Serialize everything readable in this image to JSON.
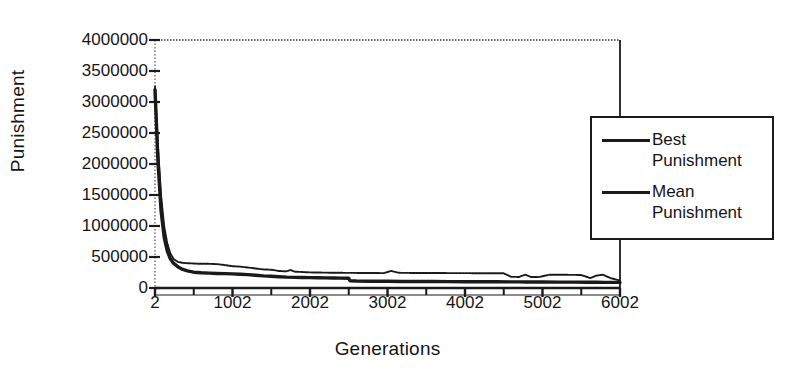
{
  "chart_data": {
    "type": "line",
    "title": "",
    "xlabel": "Generations",
    "ylabel": "Punishment",
    "xlim": [
      2,
      6002
    ],
    "ylim": [
      0,
      4000000
    ],
    "grid": false,
    "legend_position": "right",
    "x_ticks": [
      2,
      1002,
      2002,
      3002,
      4002,
      5002,
      6002
    ],
    "x_tick_labels": [
      "2",
      "1002",
      "2002",
      "3002",
      "4002",
      "5002",
      "6002"
    ],
    "x_minor_tick_step": 500,
    "y_ticks": [
      0,
      500000,
      1000000,
      1500000,
      2000000,
      2500000,
      3000000,
      3500000,
      4000000
    ],
    "y_tick_labels": [
      "0",
      "500000",
      "1000000",
      "1500000",
      "2000000",
      "2500000",
      "3000000",
      "3500000",
      "4000000"
    ],
    "series": [
      {
        "name": "Best Punishment",
        "style": "solid-thick",
        "color": "#1a1a1a",
        "x": [
          2,
          40,
          80,
          120,
          160,
          200,
          240,
          300,
          360,
          420,
          500,
          600,
          700,
          800,
          900,
          1000,
          1100,
          1200,
          1300,
          1400,
          1500,
          1600,
          1700,
          1800,
          1900,
          2000,
          2100,
          2200,
          2300,
          2400,
          2500,
          2520,
          2600,
          2800,
          3000,
          3200,
          3400,
          3600,
          3800,
          4000,
          4200,
          4400,
          4600,
          4700,
          4800,
          5000,
          5200,
          5400,
          5600,
          5700,
          5800,
          6002
        ],
        "y": [
          3200000,
          2050000,
          1250000,
          820000,
          600000,
          470000,
          400000,
          340000,
          300000,
          275000,
          255000,
          245000,
          240000,
          235000,
          232000,
          228000,
          222000,
          215000,
          205000,
          195000,
          190000,
          182000,
          175000,
          172000,
          170000,
          168000,
          166000,
          164000,
          162000,
          160000,
          158000,
          115000,
          112000,
          110000,
          108000,
          106000,
          105000,
          104000,
          103000,
          102000,
          101000,
          100000,
          99000,
          98000,
          97000,
          96000,
          95000,
          94000,
          93000,
          92000,
          91000,
          90000
        ]
      },
      {
        "name": "Mean Punishment",
        "style": "solid-thin",
        "color": "#1a1a1a",
        "x": [
          2,
          40,
          80,
          120,
          160,
          200,
          240,
          300,
          360,
          420,
          500,
          600,
          700,
          800,
          900,
          1000,
          1100,
          1200,
          1300,
          1400,
          1500,
          1600,
          1700,
          1750,
          1800,
          1900,
          2000,
          2100,
          2200,
          2300,
          2400,
          2500,
          2600,
          2800,
          2950,
          3050,
          3150,
          3300,
          3500,
          3700,
          3900,
          4100,
          4300,
          4500,
          4600,
          4700,
          4780,
          4850,
          4950,
          5100,
          5300,
          5500,
          5620,
          5700,
          5780,
          5880,
          6002
        ],
        "y": [
          3250000,
          2300000,
          1500000,
          1000000,
          720000,
          560000,
          470000,
          420000,
          405000,
          400000,
          395000,
          390000,
          390000,
          385000,
          370000,
          352000,
          345000,
          330000,
          315000,
          300000,
          295000,
          275000,
          268000,
          292000,
          265000,
          258000,
          252000,
          250000,
          248000,
          246000,
          245000,
          244000,
          243000,
          242000,
          240000,
          275000,
          245000,
          243000,
          242000,
          241000,
          240000,
          239000,
          238000,
          237000,
          180000,
          178000,
          215000,
          178000,
          176000,
          215000,
          213000,
          210000,
          160000,
          200000,
          215000,
          160000,
          120000
        ]
      }
    ]
  },
  "legend": {
    "entries": [
      {
        "label": "Best\nPunishment",
        "swatch": "solid-thick-line-swatch"
      },
      {
        "label": "Mean\nPunishment",
        "swatch": "solid-thin-line-swatch"
      }
    ]
  }
}
